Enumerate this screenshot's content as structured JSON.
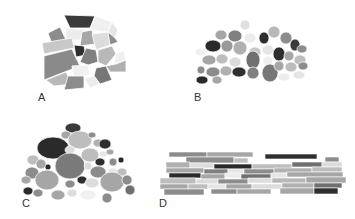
{
  "figure": {
    "panels": [
      {
        "id": "A",
        "label": "A",
        "description": "Angular polygonal fragments (Voronoi-like tessellation)"
      },
      {
        "id": "B",
        "label": "B",
        "description": "Rounded cobbles of similar size, loosely packed mound"
      },
      {
        "id": "C",
        "label": "C",
        "description": "Mixed-size rounded clasts, poorly sorted mound"
      },
      {
        "id": "D",
        "label": "D",
        "description": "Elongated platy/tabular slabs stacked horizontally"
      }
    ],
    "palette": {
      "white": "#f2f2f2",
      "very_light": "#dcdcdc",
      "light": "#bdbdbd",
      "mid_light": "#a6a6a6",
      "mid": "#8c8c8c",
      "mid_dark": "#707070",
      "dark": "#3a3a3a",
      "outline": "#ffffff"
    }
  }
}
